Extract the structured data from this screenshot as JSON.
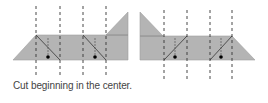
{
  "caption": "Cut beginning in the center.",
  "colors": {
    "paper_fill": "#b4b4b4",
    "paper_edge": "#9a9a9a",
    "dash": "#333333",
    "cut_line": "#333333",
    "dot": "#000000"
  },
  "figures": [
    {
      "name": "left-strip",
      "fold_lines_x": [
        36,
        60,
        83,
        106
      ]
    },
    {
      "name": "right-strip",
      "fold_lines_x": [
        164,
        187,
        210,
        232
      ]
    }
  ]
}
